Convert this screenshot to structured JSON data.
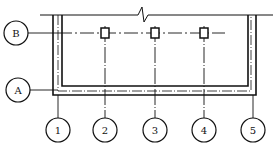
{
  "diagram": {
    "type": "structural-axis-grid-plan",
    "horizontal_axes": [
      {
        "label": "B",
        "y": 33
      },
      {
        "label": "A",
        "y": 90
      }
    ],
    "vertical_axes": [
      {
        "label": "1",
        "x": 58
      },
      {
        "label": "2",
        "x": 105
      },
      {
        "label": "3",
        "x": 155
      },
      {
        "label": "4",
        "x": 204
      },
      {
        "label": "5",
        "x": 253
      }
    ],
    "columns_on_axis": "B",
    "column_count": 3,
    "break_symbol": "top-edge-break",
    "colors": {
      "line": "#111111",
      "background": "#ffffff"
    }
  }
}
